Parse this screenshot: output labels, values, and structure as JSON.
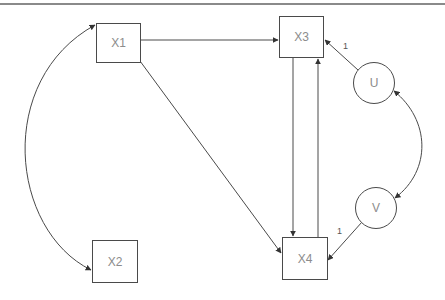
{
  "diagram": {
    "type": "path-diagram",
    "nodes": [
      {
        "id": "X1",
        "label": "X1",
        "shape": "rectangle"
      },
      {
        "id": "X2",
        "label": "X2",
        "shape": "rectangle"
      },
      {
        "id": "X3",
        "label": "X3",
        "shape": "rectangle"
      },
      {
        "id": "X4",
        "label": "X4",
        "shape": "rectangle"
      },
      {
        "id": "U",
        "label": "U",
        "shape": "circle"
      },
      {
        "id": "V",
        "label": "V",
        "shape": "circle"
      }
    ],
    "edges": [
      {
        "from": "X1",
        "to": "X3",
        "type": "directed",
        "label": ""
      },
      {
        "from": "X1",
        "to": "X4",
        "type": "directed",
        "label": ""
      },
      {
        "from": "X3",
        "to": "X4",
        "type": "directed",
        "label": ""
      },
      {
        "from": "X4",
        "to": "X3",
        "type": "directed",
        "label": ""
      },
      {
        "from": "U",
        "to": "X3",
        "type": "directed",
        "label": "1"
      },
      {
        "from": "V",
        "to": "X4",
        "type": "directed",
        "label": "1"
      },
      {
        "from": "X1",
        "to": "X2",
        "type": "bidirectional-curved",
        "label": ""
      },
      {
        "from": "U",
        "to": "V",
        "type": "bidirectional-curved",
        "label": ""
      }
    ],
    "labels": {
      "u_to_x3": "1",
      "v_to_x4": "1"
    }
  },
  "colors": {
    "stroke": "#4a4a4a",
    "text": "#8c8c8c",
    "rule": "#8a8a8a",
    "background": "#ffffff"
  }
}
